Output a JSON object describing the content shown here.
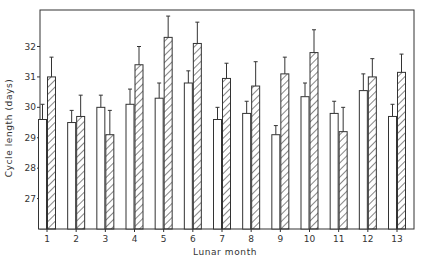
{
  "chart_data": {
    "type": "bar",
    "title": "",
    "xlabel": "Lunar month",
    "ylabel": "Cycle length (days)",
    "ylim": [
      26.0,
      33.2
    ],
    "yticks": [
      27,
      28,
      29,
      30,
      31,
      32
    ],
    "grid": false,
    "legend": null,
    "categories": [
      "1",
      "2",
      "3",
      "4",
      "5",
      "6",
      "7",
      "8",
      "9",
      "10",
      "11",
      "12",
      "13"
    ],
    "series": [
      {
        "name": "open",
        "style": "open",
        "values": [
          29.6,
          29.5,
          30.0,
          30.1,
          30.3,
          30.8,
          29.6,
          29.8,
          29.1,
          30.35,
          29.8,
          30.55,
          29.7
        ],
        "error_upper": [
          30.1,
          29.9,
          30.4,
          30.6,
          30.8,
          31.2,
          30.0,
          30.2,
          29.4,
          30.8,
          30.2,
          31.1,
          30.1
        ]
      },
      {
        "name": "hatched",
        "style": "hatched",
        "values": [
          31.0,
          29.7,
          29.1,
          31.4,
          32.3,
          32.1,
          30.95,
          30.7,
          31.1,
          31.8,
          29.2,
          31.0,
          31.15
        ],
        "error_upper": [
          31.65,
          30.4,
          29.9,
          32.0,
          33.0,
          32.8,
          31.45,
          31.5,
          31.65,
          32.55,
          30.0,
          31.6,
          31.75
        ]
      }
    ]
  },
  "axes": {
    "xlabel": "Lunar month",
    "ylabel": "Cycle length (days)"
  }
}
